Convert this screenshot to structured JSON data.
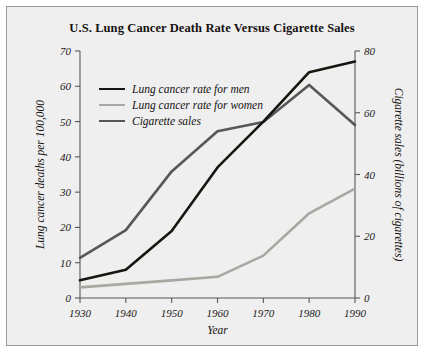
{
  "figure": {
    "title": "U.S. Lung Cancer Death Rate Versus Cigarette Sales",
    "background_color": "#efefef",
    "border_color": "#9a9a9a"
  },
  "legend": {
    "position": "top-left-inside",
    "entries": [
      {
        "label": "Lung cancer rate for men",
        "color": "#17150f"
      },
      {
        "label": "Lung cancer rate for women",
        "color": "#a8a8a2"
      },
      {
        "label": "Cigarette sales",
        "color": "#58565a"
      }
    ]
  },
  "axes": {
    "x": {
      "label": "Year",
      "ticks": [
        "1930",
        "1940",
        "1950",
        "1960",
        "1970",
        "1980",
        "1990"
      ]
    },
    "y_left": {
      "label": "Lung cancer deaths per 100,000",
      "ticks": [
        "0",
        "10",
        "20",
        "30",
        "40",
        "50",
        "60",
        "70"
      ]
    },
    "y_right": {
      "label": "Cigarette sales (billions of cigarettes)",
      "ticks": [
        "0",
        "20",
        "40",
        "60",
        "80"
      ]
    }
  },
  "chart_data": {
    "type": "line",
    "title": "U.S. Lung Cancer Death Rate Versus Cigarette Sales",
    "xlabel": "Year",
    "ylabel": "Lung cancer deaths per 100,000",
    "ylabel_secondary": "Cigarette sales (billions of cigarettes)",
    "x": [
      1930,
      1940,
      1950,
      1960,
      1970,
      1980,
      1990
    ],
    "xlim": [
      1930,
      1990
    ],
    "ylim": [
      0,
      70
    ],
    "ylim_secondary": [
      0,
      80
    ],
    "grid": false,
    "series": [
      {
        "name": "Lung cancer rate for men",
        "axis": "left",
        "color": "#17150f",
        "values": [
          5,
          8,
          19,
          37,
          50,
          64,
          67
        ]
      },
      {
        "name": "Lung cancer rate for women",
        "axis": "left",
        "color": "#a8a8a2",
        "values": [
          3,
          4,
          5,
          6,
          12,
          24,
          31
        ]
      },
      {
        "name": "Cigarette sales",
        "axis": "right",
        "color": "#58565a",
        "values": [
          13,
          22,
          41,
          54,
          57,
          69,
          56
        ]
      }
    ]
  }
}
